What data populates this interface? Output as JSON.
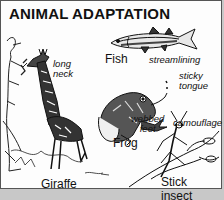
{
  "title": "ANIMAL ADAPTATION",
  "animals": [
    {
      "name": "Giraffe",
      "adaptation": "long neck"
    },
    {
      "name": "Fish",
      "adaptation": "streamlining"
    },
    {
      "name": "Frog",
      "adaptations": [
        "sticky tongue",
        "webbed feet"
      ]
    },
    {
      "name": "Stick insect",
      "adaptation": "camouflage"
    }
  ],
  "labels": {
    "giraffe": "Giraffe",
    "fish": "Fish",
    "frog": "Frog",
    "stick_insect": "Stick insect"
  },
  "notes": {
    "long": "long",
    "neck": "neck",
    "streamlining": "streamlining",
    "sticky": "sticky",
    "tongue": "tongue",
    "webbed": "webbed",
    "feet": "feet",
    "camouflage": "camouflage"
  }
}
